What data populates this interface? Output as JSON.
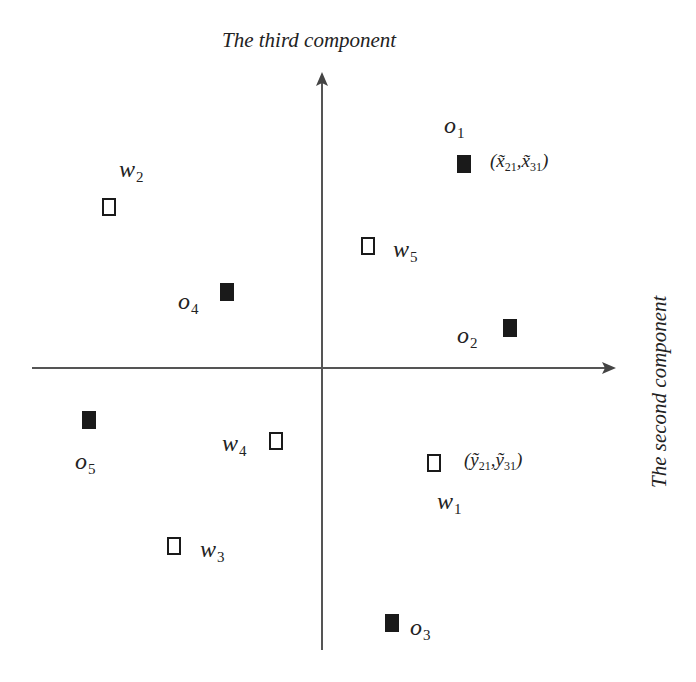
{
  "axes": {
    "vertical_title": "The third component",
    "horizontal_title": "The second component",
    "stroke_color": "#555555"
  },
  "points": [
    {
      "id": "o1",
      "name": "o",
      "sub": "1",
      "kind": "filled",
      "x": 464,
      "y": 164,
      "label_pos": "above-left"
    },
    {
      "id": "o2",
      "name": "o",
      "sub": "2",
      "kind": "filled",
      "x": 510,
      "y": 328,
      "label_pos": "left-below"
    },
    {
      "id": "o3",
      "name": "o",
      "sub": "3",
      "kind": "filled",
      "x": 392,
      "y": 623,
      "label_pos": "right"
    },
    {
      "id": "o4",
      "name": "o",
      "sub": "4",
      "kind": "filled",
      "x": 227,
      "y": 292,
      "label_pos": "left-below"
    },
    {
      "id": "o5",
      "name": "o",
      "sub": "5",
      "kind": "filled",
      "x": 89,
      "y": 420,
      "label_pos": "below"
    },
    {
      "id": "w1",
      "name": "w",
      "sub": "1",
      "kind": "open",
      "x": 434,
      "y": 463,
      "label_pos": "below"
    },
    {
      "id": "w2",
      "name": "w",
      "sub": "2",
      "kind": "open",
      "x": 109,
      "y": 207,
      "label_pos": "above"
    },
    {
      "id": "w3",
      "name": "w",
      "sub": "3",
      "kind": "open",
      "x": 174,
      "y": 546,
      "label_pos": "right"
    },
    {
      "id": "w4",
      "name": "w",
      "sub": "4",
      "kind": "open",
      "x": 276,
      "y": 441,
      "label_pos": "left"
    },
    {
      "id": "w5",
      "name": "w",
      "sub": "5",
      "kind": "open",
      "x": 368,
      "y": 246,
      "label_pos": "right"
    }
  ],
  "annotations": {
    "o1_coord": {
      "open": "(",
      "a_base": "x̃",
      "a_sub": "21",
      "sep": ",",
      "b_base": "x̃",
      "b_sub": "31",
      "close": ")"
    },
    "w1_coord": {
      "open": "(",
      "a_base": "ỹ",
      "a_sub": "21",
      "sep": ",",
      "b_base": "ỹ",
      "b_sub": "31",
      "close": ")"
    }
  },
  "labels": {
    "o1": {
      "base": "o",
      "sub": "1"
    },
    "o2": {
      "base": "o",
      "sub": "2"
    },
    "o3": {
      "base": "o",
      "sub": "3"
    },
    "o4": {
      "base": "o",
      "sub": "4"
    },
    "o5": {
      "base": "o",
      "sub": "5"
    },
    "w1": {
      "base": "w",
      "sub": "1"
    },
    "w2": {
      "base": "w",
      "sub": "2"
    },
    "w3": {
      "base": "w",
      "sub": "3"
    },
    "w4": {
      "base": "w",
      "sub": "4"
    },
    "w5": {
      "base": "w",
      "sub": "5"
    }
  }
}
